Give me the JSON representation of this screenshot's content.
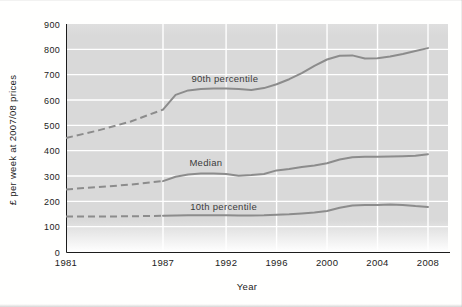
{
  "chart_data": {
    "type": "line",
    "title": "",
    "xlabel": "Year",
    "ylabel": "£ per week at 2007/08 prices",
    "xlim": [
      1981,
      2008
    ],
    "ylim": [
      0,
      900
    ],
    "x_ticks": [
      "1981",
      "1987",
      "1992",
      "1996",
      "2000",
      "2004",
      "2008"
    ],
    "y_ticks": [
      "0",
      "100",
      "200",
      "300",
      "400",
      "500",
      "600",
      "700",
      "800",
      "900"
    ],
    "grid": true,
    "legend": "inline-labels",
    "dashed_segment_years": [
      1981,
      1987
    ],
    "x": [
      1981,
      1983,
      1985,
      1987,
      1988,
      1989,
      1990,
      1991,
      1992,
      1993,
      1994,
      1995,
      1996,
      1997,
      1998,
      1999,
      2000,
      2001,
      2002,
      2003,
      2004,
      2005,
      2006,
      2007,
      2008
    ],
    "series": [
      {
        "name": "90th percentile",
        "values": [
          450,
          480,
          515,
          562,
          620,
          638,
          643,
          645,
          645,
          643,
          640,
          647,
          662,
          682,
          706,
          735,
          760,
          775,
          776,
          764,
          765,
          772,
          782,
          793,
          805
        ],
        "label_anchor": {
          "year": 1991.9,
          "value": 683
        }
      },
      {
        "name": "Median",
        "values": [
          247,
          256,
          266,
          280,
          297,
          306,
          310,
          310,
          308,
          301,
          304,
          308,
          322,
          328,
          335,
          342,
          350,
          365,
          374,
          376,
          376,
          377,
          378,
          380,
          386
        ],
        "label_anchor": {
          "year": 1990.4,
          "value": 351
        }
      },
      {
        "name": "10th percentile",
        "values": [
          140,
          140,
          141,
          143,
          144,
          145,
          145,
          145,
          145,
          144,
          144,
          145,
          147,
          149,
          152,
          156,
          162,
          175,
          184,
          186,
          186,
          188,
          186,
          181,
          178
        ],
        "label_anchor": {
          "year": 1991.8,
          "value": 178
        }
      }
    ]
  },
  "colors": {
    "plot_background": "#d9d9d9",
    "gridline": "#ffffff",
    "series_line": "#8c8c8c",
    "axis": "#1c1c1c",
    "tick_text": "#1c1c1c",
    "series_label_text": "#3c3c3c"
  }
}
